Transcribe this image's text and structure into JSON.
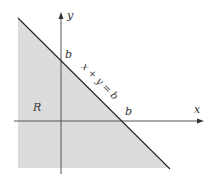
{
  "diagram": {
    "type": "region-plot",
    "region_label": "R",
    "line_equation": "x + y = b",
    "x_axis_label": "x",
    "y_axis_label": "y",
    "x_intercept_label": "b",
    "y_intercept_label": "b",
    "colors": {
      "background": "#ffffff",
      "region_fill": "#dcdcdc",
      "line": "#222222",
      "axis": "#555555",
      "text": "#333333"
    }
  }
}
